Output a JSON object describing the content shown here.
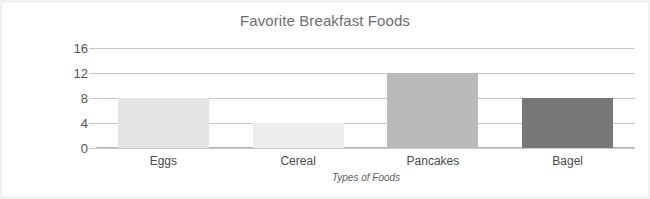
{
  "chart_data": {
    "type": "bar",
    "title": "Favorite Breakfast Foods",
    "xlabel": "Types of Foods",
    "ylabel": "Number of Students",
    "categories": [
      "Eggs",
      "Cereal",
      "Pancakes",
      "Bagel"
    ],
    "values": [
      8,
      4,
      12,
      8
    ],
    "ylim": [
      0,
      16
    ],
    "ytick_values": [
      0,
      4,
      8,
      12,
      16
    ],
    "ytick_labels": [
      "0",
      "4",
      "8",
      "12",
      "16"
    ],
    "grid": true,
    "legend": false,
    "bar_colors": [
      "#e3e3e3",
      "#ededed",
      "#bababa",
      "#777777"
    ],
    "bars": [
      {
        "label": "Eggs",
        "value": 8,
        "value_label": "8",
        "color": "#e3e3e3"
      },
      {
        "label": "Cereal",
        "value": 4,
        "value_label": "4",
        "color": "#ededed"
      },
      {
        "label": "Pancakes",
        "value": 12,
        "value_label": "12",
        "color": "#bababa"
      },
      {
        "label": "Bagel",
        "value": 8,
        "value_label": "8",
        "color": "#777777"
      }
    ]
  },
  "style": {
    "background": "#ffffff",
    "gridline_color": "#c9c9c9",
    "axis_color": "#b4b4b4",
    "title_color": "#6e6e6e",
    "label_color": "#4a4a4a"
  }
}
